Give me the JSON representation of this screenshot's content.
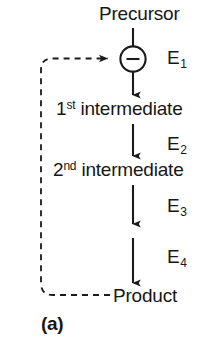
{
  "figure": {
    "panel_label": "(a)",
    "type": "metabolic-pathway-feedback-inhibition-diagram",
    "nodes": [
      {
        "id": "precursor",
        "label": "Precursor"
      },
      {
        "id": "summing",
        "label": "−",
        "shape": "circle",
        "name": "feedback-inhibition-junction"
      },
      {
        "id": "intermediate1",
        "ordinal": "1",
        "ordinal_suffix": "st",
        "rest": " intermediate",
        "label": "1st intermediate"
      },
      {
        "id": "intermediate2",
        "ordinal": "2",
        "ordinal_suffix": "nd",
        "rest": " intermediate",
        "label": "2nd intermediate"
      },
      {
        "id": "product",
        "label": "Product"
      }
    ],
    "enzymes": [
      {
        "id": "e1",
        "symbol": "E",
        "index": "1",
        "label": "E1"
      },
      {
        "id": "e2",
        "symbol": "E",
        "index": "2",
        "label": "E2"
      },
      {
        "id": "e3",
        "symbol": "E",
        "index": "3",
        "label": "E3"
      },
      {
        "id": "e4",
        "symbol": "E",
        "index": "4",
        "label": "E4"
      }
    ],
    "feedback": {
      "style": "dashed",
      "from": "product",
      "to": "summing",
      "sign": "−"
    },
    "colors": {
      "stroke": "#1a1a1a",
      "text": "#161616",
      "background": "#ffffff"
    }
  }
}
